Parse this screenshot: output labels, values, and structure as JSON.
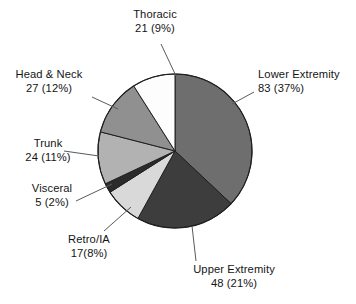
{
  "chart_data": {
    "type": "pie",
    "title": "",
    "subtitle": "",
    "xlabel": "",
    "ylabel": "",
    "legend_position": "none",
    "grid": false,
    "total": 225,
    "start_angle_deg": 0,
    "direction": "clockwise",
    "categories": [
      "Lower Extremity",
      "Upper Extremity",
      "Retro/IA",
      "Visceral",
      "Trunk",
      "Head & Neck",
      "Thoracic"
    ],
    "values": [
      83,
      48,
      17,
      5,
      24,
      27,
      21
    ],
    "percents": [
      37,
      21,
      8,
      2,
      11,
      12,
      9
    ],
    "colors": [
      "#6e6e6e",
      "#3d3d3d",
      "#d9d9d9",
      "#2b2b2b",
      "#b2b2b2",
      "#909090",
      "#fdfdfd"
    ],
    "slices": [
      {
        "name": "Lower Extremity",
        "value": 83,
        "percent": 37,
        "color": "#6e6e6e",
        "label_line1": "Lower Extremity",
        "label_line2": "83 (37%)"
      },
      {
        "name": "Upper Extremity",
        "value": 48,
        "percent": 21,
        "color": "#3d3d3d",
        "label_line1": "Upper Extremity",
        "label_line2": "48 (21%)"
      },
      {
        "name": "Retro/IA",
        "value": 17,
        "percent": 8,
        "color": "#d9d9d9",
        "label_line1": "Retro/IA",
        "label_line2": "17(8%)"
      },
      {
        "name": "Visceral",
        "value": 5,
        "percent": 2,
        "color": "#2b2b2b",
        "label_line1": "Visceral",
        "label_line2": "5 (2%)"
      },
      {
        "name": "Trunk",
        "value": 24,
        "percent": 11,
        "color": "#b2b2b2",
        "label_line1": "Trunk",
        "label_line2": "24 (11%)"
      },
      {
        "name": "Head & Neck",
        "value": 27,
        "percent": 12,
        "color": "#909090",
        "label_line1": "Head & Neck",
        "label_line2": "27 (12%)"
      },
      {
        "name": "Thoracic",
        "value": 21,
        "percent": 9,
        "color": "#fdfdfd",
        "label_line1": "Thoracic",
        "label_line2": "21 (9%)"
      }
    ]
  },
  "style": {
    "background": "#ffffff",
    "stroke": "#1f1f1f",
    "leader_line": "#5a5a5a",
    "text": "#151515"
  }
}
